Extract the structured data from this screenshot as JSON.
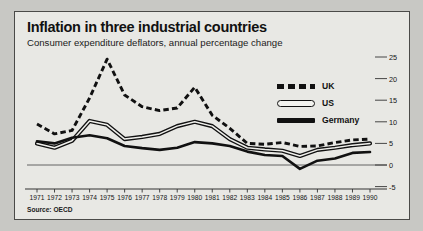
{
  "figure": {
    "title": "Inflation in three industrial countries",
    "subtitle": "Consumer expenditure deflators, annual percentage change",
    "source": "Source: OECD"
  },
  "legend": {
    "items": [
      {
        "label": "UK",
        "style": "dashed",
        "color": "#111111"
      },
      {
        "label": "US",
        "style": "hollow",
        "color": "#111111"
      },
      {
        "label": "Germany",
        "style": "solid",
        "color": "#111111"
      }
    ]
  },
  "chart_data": {
    "type": "line",
    "title": "Inflation in three industrial countries",
    "subtitle": "Consumer expenditure deflators, annual percentage change",
    "xlabel": "",
    "ylabel": "",
    "ylim": [
      -5,
      25
    ],
    "yticks": [
      -5,
      0,
      5,
      10,
      15,
      20,
      25
    ],
    "ytick_labels": [
      "-5",
      "0",
      "5",
      "10",
      "15",
      "20",
      "25"
    ],
    "y_axis_position": "right",
    "grid": false,
    "zero_line": true,
    "legend_position": "upper-center-right",
    "x": [
      1971,
      1972,
      1973,
      1974,
      1975,
      1976,
      1977,
      1978,
      1979,
      1980,
      1981,
      1982,
      1983,
      1984,
      1985,
      1986,
      1987,
      1988,
      1989,
      1990
    ],
    "xtick_labels": [
      "1971",
      "1972",
      "1973",
      "1974",
      "1975",
      "1976",
      "1977",
      "1978",
      "1979",
      "1980",
      "1981",
      "1982",
      "1983",
      "1984",
      "1985",
      "1986",
      "1987",
      "1988",
      "1989",
      "1990"
    ],
    "series": [
      {
        "name": "UK",
        "style": "dashed",
        "color": "#111111",
        "values": [
          9.5,
          7.2,
          8.0,
          15.5,
          24.5,
          16.2,
          13.5,
          12.6,
          13.2,
          18.0,
          11.5,
          8.5,
          5.0,
          4.8,
          5.2,
          4.3,
          4.4,
          5.2,
          5.8,
          6.0
        ]
      },
      {
        "name": "US",
        "style": "hollow",
        "color": "#111111",
        "values": [
          5.0,
          4.0,
          5.6,
          10.2,
          9.3,
          6.0,
          6.5,
          7.2,
          9.0,
          10.0,
          9.0,
          6.0,
          4.0,
          3.6,
          3.3,
          2.1,
          3.5,
          4.0,
          4.6,
          5.0
        ]
      },
      {
        "name": "Germany",
        "style": "solid",
        "color": "#111111",
        "values": [
          5.5,
          5.0,
          6.3,
          6.9,
          6.2,
          4.4,
          3.9,
          3.5,
          4.0,
          5.3,
          5.0,
          4.4,
          3.1,
          2.3,
          2.1,
          -0.9,
          1.0,
          1.5,
          2.8,
          3.0
        ]
      }
    ]
  }
}
